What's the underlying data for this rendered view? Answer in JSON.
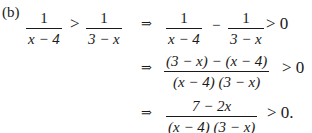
{
  "part_label": "(b)",
  "arrow": "⇒",
  "lhs": {
    "frac1": {
      "num": "1",
      "den": "x − 4"
    },
    "relation": ">",
    "frac2": {
      "num": "1",
      "den": "3 − x"
    }
  },
  "steps": [
    {
      "frac1": {
        "num": "1",
        "den": "x − 4"
      },
      "operator": "−",
      "frac2": {
        "num": "1",
        "den": "3 − x"
      },
      "tail": "> 0"
    },
    {
      "frac": {
        "num": "(3 − x) − (x − 4)",
        "den": "(x − 4) (3 − x)"
      },
      "tail": "> 0"
    },
    {
      "frac": {
        "num": "7 − 2x",
        "den": "(x − 4) (3 − x)"
      },
      "tail": "> 0."
    }
  ]
}
